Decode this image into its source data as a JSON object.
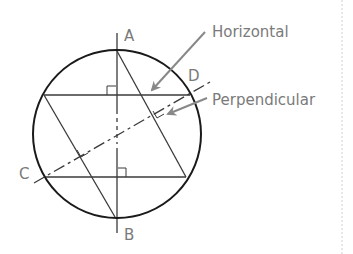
{
  "diagram": {
    "points": {
      "A": "A",
      "B": "B",
      "C": "C",
      "D": "D"
    },
    "callouts": {
      "horizontal": "Horizontal",
      "perpendicular": "Perpendicular"
    },
    "colors": {
      "circle": "#1a1a1a",
      "lines": "#3a3a3a",
      "labels": "#7a7a7a",
      "arrows": "#888888",
      "border": "#cccccc"
    }
  }
}
